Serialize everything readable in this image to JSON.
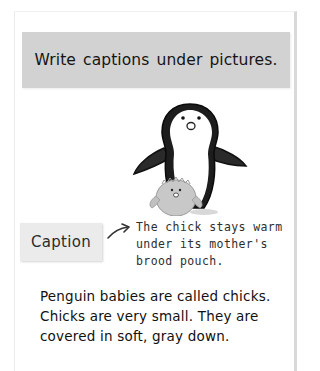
{
  "title": "Write captions under pictures.",
  "illustration": {
    "subject": "penguin-with-chick",
    "description": "Adult penguin standing with a fluffy gray chick in front"
  },
  "caption_label": "Caption",
  "caption_lines": [
    "The chick stays warm",
    "under its mother's",
    "brood pouch."
  ],
  "body_lines": [
    "Penguin babies are called chicks.",
    "Chicks are very small. They are",
    "covered in soft, gray down."
  ],
  "colors": {
    "title_bg": "#d2d2d2",
    "caption_bg": "#ebebeb",
    "text": "#111111"
  }
}
